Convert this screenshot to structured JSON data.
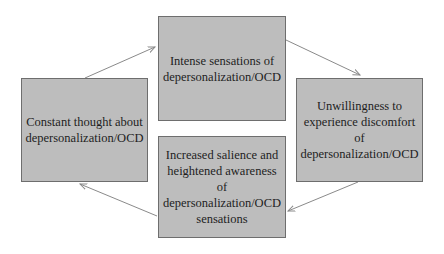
{
  "diagram": {
    "type": "cycle",
    "nodes": [
      {
        "id": "top",
        "label": "Intense sensations of\ndepersonalization/OCD"
      },
      {
        "id": "right",
        "label": "Unwillingness to\nexperience discomfort of\ndepersonalization/OCD"
      },
      {
        "id": "bottom",
        "label": "Increased salience and\nheightened awareness of\ndepersonalization/OCD\nsensations"
      },
      {
        "id": "left",
        "label": "Constant thought about\ndepersonalization/OCD"
      }
    ],
    "edges": [
      {
        "from": "left",
        "to": "top"
      },
      {
        "from": "top",
        "to": "right"
      },
      {
        "from": "right",
        "to": "bottom"
      },
      {
        "from": "bottom",
        "to": "left"
      }
    ],
    "colors": {
      "box_fill": "#bdbdbd",
      "box_border": "#6e6e6e",
      "arrow": "#8a8a8a",
      "text": "#1e1e1e"
    }
  }
}
